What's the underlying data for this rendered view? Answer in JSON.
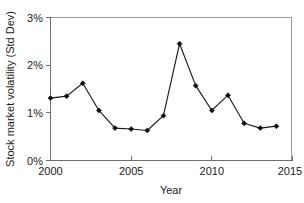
{
  "chart_data": {
    "type": "line",
    "title": "",
    "xlabel": "Year",
    "ylabel": "Stock market volatility (Std Dev)",
    "xlim": [
      2000,
      2015
    ],
    "ylim": [
      0,
      3
    ],
    "grid": false,
    "legend": "none",
    "x_tick_labels": [
      "2000",
      "2005",
      "2010",
      "2015"
    ],
    "x_tick_values": [
      2000,
      2005,
      2010,
      2015
    ],
    "y_tick_labels": [
      "0%",
      "1%",
      "2%",
      "3%"
    ],
    "y_tick_values": [
      0,
      1,
      2,
      3
    ],
    "y_unit": "%",
    "marker": "diamond",
    "line_color": "#1a1a1a",
    "marker_color": "#0d0d0d",
    "x": [
      2000,
      2001,
      2002,
      2003,
      2004,
      2005,
      2006,
      2007,
      2008,
      2009,
      2010,
      2011,
      2012,
      2013,
      2014
    ],
    "values": [
      1.31,
      1.35,
      1.62,
      1.05,
      0.68,
      0.66,
      0.63,
      0.94,
      2.45,
      1.57,
      1.05,
      1.37,
      0.78,
      0.68,
      0.72
    ],
    "series": [
      {
        "name": "Stock market volatility",
        "values": [
          1.31,
          1.35,
          1.62,
          1.05,
          0.68,
          0.66,
          0.63,
          0.94,
          2.45,
          1.57,
          1.05,
          1.37,
          0.78,
          0.68,
          0.72
        ]
      }
    ]
  }
}
